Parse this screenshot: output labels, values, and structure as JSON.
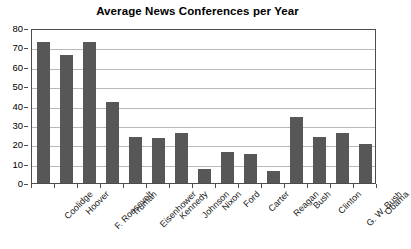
{
  "chart_data": {
    "type": "bar",
    "title": "Average News Conferences per Year",
    "xlabel": "",
    "ylabel": "",
    "ylim": [
      0,
      80
    ],
    "ytick_step": 10,
    "yticks": [
      0,
      10,
      20,
      30,
      40,
      50,
      60,
      70,
      80
    ],
    "grid": true,
    "legend": false,
    "legend_position": "none",
    "bar_color": "#575757",
    "gridline_color": "#b8b8b8",
    "axis_color": "#4d4d4d",
    "background_color": "#ffffff",
    "categories": [
      "Coolidge",
      "Hoover",
      "F. Roosevelt",
      "Truman",
      "Eisenhower",
      "Kennedy",
      "Johnson",
      "Nixon",
      "Ford",
      "Carter",
      "Reagan",
      "Bush",
      "Clinton",
      "G. W. Bush",
      "Obama"
    ],
    "values": [
      73,
      66,
      73,
      42,
      24,
      23,
      26,
      7,
      16,
      15,
      6,
      34,
      24,
      26,
      20
    ]
  }
}
